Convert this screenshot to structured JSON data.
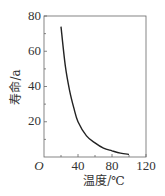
{
  "chart_data": {
    "type": "line",
    "title": "",
    "xlabel": "温度/℃",
    "ylabel": "寿命/a",
    "origin_label": "O",
    "xlim": [
      0,
      120
    ],
    "ylim": [
      0,
      80
    ],
    "x_ticks": [
      40,
      80,
      120
    ],
    "y_ticks": [
      20,
      40,
      60,
      80
    ],
    "x_tick_labels": [
      "40",
      "80",
      "120"
    ],
    "y_tick_labels": [
      "20",
      "40",
      "60",
      "80"
    ],
    "grid": false,
    "legend": null,
    "series": [
      {
        "name": "寿命",
        "x": [
          20,
          25,
          30,
          35,
          40,
          50,
          60,
          70,
          80,
          90,
          100
        ],
        "values": [
          74,
          52,
          38,
          28,
          20,
          12,
          8,
          5,
          3.5,
          2.2,
          1.5
        ]
      }
    ],
    "colors": {
      "line": "#222222",
      "axis": "#555555",
      "text": "#333333"
    }
  }
}
